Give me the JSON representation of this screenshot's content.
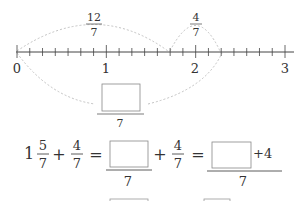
{
  "number_line": {
    "labels": [
      "0",
      "1",
      "2",
      "3"
    ],
    "arc_top_left": {
      "numerator": "12",
      "denominator": "7"
    },
    "arc_top_right": {
      "numerator": "4",
      "denominator": "7"
    },
    "answer_box_denominator": "7"
  },
  "equation": {
    "whole": "1",
    "frac1": {
      "numerator": "5",
      "denominator": "7"
    },
    "plus": "+",
    "frac2": {
      "numerator": "4",
      "denominator": "7"
    },
    "equals": "=",
    "step1_denominator": "7",
    "frac3": {
      "numerator": "4",
      "denominator": "7"
    },
    "step2_numerator_suffix": "+4",
    "step2_denominator": "7"
  }
}
